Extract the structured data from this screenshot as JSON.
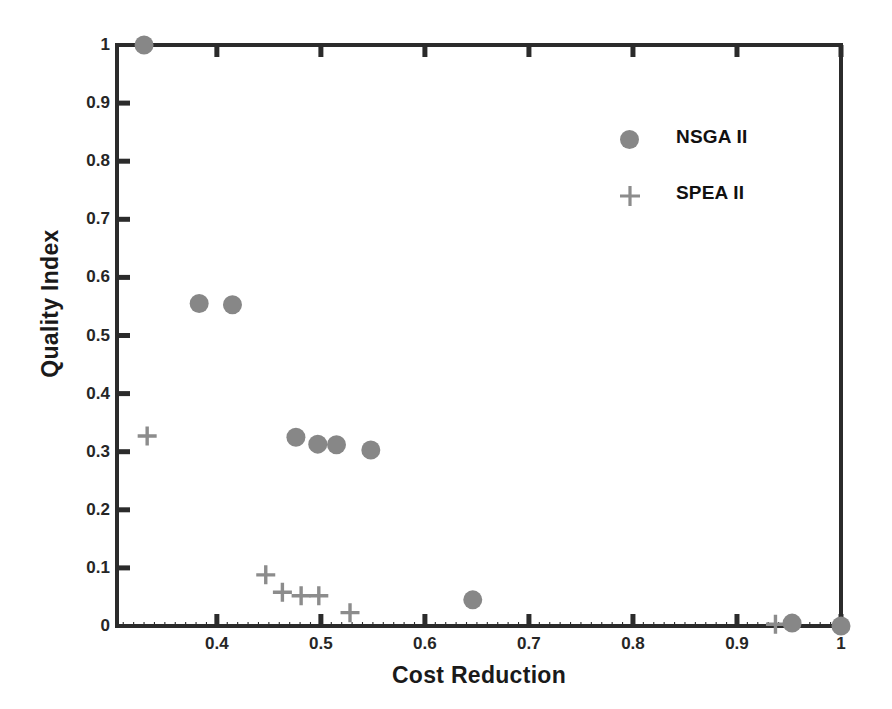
{
  "chart_data": {
    "type": "scatter",
    "title": "",
    "xlabel": "Cost Reduction",
    "ylabel": "Quality Index",
    "xlim": [
      0.304,
      1.0
    ],
    "ylim": [
      0.0,
      1.0
    ],
    "xticks": [
      0.4,
      0.5,
      0.6,
      0.7,
      0.8,
      0.9,
      1.0
    ],
    "xtick_labels": [
      "0.4",
      "0.5",
      "0.6",
      "0.7",
      "0.8",
      "0.9",
      "1"
    ],
    "yticks": [
      0,
      0.1,
      0.2,
      0.3,
      0.4,
      0.5,
      0.6,
      0.7,
      0.8,
      0.9,
      1.0
    ],
    "ytick_labels": [
      "0",
      "0.1",
      "0.2",
      "0.3",
      "0.4",
      "0.5",
      "0.6",
      "0.7",
      "0.8",
      "0.9",
      "1"
    ],
    "grid": false,
    "legend_position": "upper right",
    "series": [
      {
        "name": "NSGA II",
        "marker": "circle",
        "color": "#878787",
        "points": [
          [
            0.33,
            1.0
          ],
          [
            0.383,
            0.555
          ],
          [
            0.415,
            0.553
          ],
          [
            0.476,
            0.325
          ],
          [
            0.497,
            0.313
          ],
          [
            0.515,
            0.312
          ],
          [
            0.548,
            0.303
          ],
          [
            0.646,
            0.045
          ],
          [
            0.953,
            0.005
          ],
          [
            1.0,
            0.0
          ]
        ]
      },
      {
        "name": "SPEA II",
        "marker": "plus",
        "color": "#8c8c8c",
        "points": [
          [
            0.333,
            0.327
          ],
          [
            0.447,
            0.088
          ],
          [
            0.463,
            0.058
          ],
          [
            0.481,
            0.052
          ],
          [
            0.498,
            0.052
          ],
          [
            0.528,
            0.023
          ],
          [
            0.937,
            0.003
          ]
        ]
      }
    ]
  },
  "legend": {
    "items": [
      {
        "label": "NSGA II",
        "marker": "circle-marker"
      },
      {
        "label": "SPEA II",
        "marker": "plus-marker"
      }
    ]
  },
  "axes": {
    "x_label": "Cost Reduction",
    "y_label": "Quality Index"
  },
  "colors": {
    "axis": "#2b2b2b",
    "marker": "#878787",
    "text": "#1a1a1a"
  }
}
